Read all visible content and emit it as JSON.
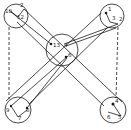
{
  "diagram": {
    "stroke_color": "#1a1a1a",
    "background": "#ffffff",
    "clusters": [
      {
        "id": "top-left",
        "cx": 16,
        "cy": 16,
        "r": 12,
        "labels": [
          {
            "text": "10",
            "x": 5,
            "y": 13
          },
          {
            "text": "2",
            "x": 20,
            "y": 7
          },
          {
            "text": "12",
            "x": 17,
            "y": 19
          }
        ]
      },
      {
        "id": "top-right",
        "cx": 112,
        "cy": 16,
        "r": 12,
        "labels": [
          {
            "text": "1",
            "x": 108,
            "y": 11
          },
          {
            "text": "3",
            "x": 112,
            "y": 20
          },
          {
            "text": "2",
            "x": 119,
            "y": 21
          }
        ]
      },
      {
        "id": "center",
        "cx": 62,
        "cy": 50,
        "r": 16,
        "labels": [
          {
            "text": "13",
            "x": 53,
            "y": 47
          },
          {
            "text": "4",
            "x": 64,
            "y": 47
          },
          {
            "text": "6",
            "x": 68,
            "y": 57
          }
        ]
      },
      {
        "id": "bottom-left",
        "cx": 18,
        "cy": 110,
        "r": 13,
        "labels": [
          {
            "text": "9",
            "x": 6,
            "y": 112
          },
          {
            "text": "7",
            "x": 18,
            "y": 120
          },
          {
            "text": "8",
            "x": 26,
            "y": 112
          }
        ]
      },
      {
        "id": "bottom-right",
        "cx": 113,
        "cy": 110,
        "r": 13,
        "labels": [
          {
            "text": "4",
            "x": 115,
            "y": 103
          },
          {
            "text": "6",
            "x": 107,
            "y": 119
          },
          {
            "text": "5",
            "x": 118,
            "y": 119
          }
        ]
      }
    ]
  }
}
